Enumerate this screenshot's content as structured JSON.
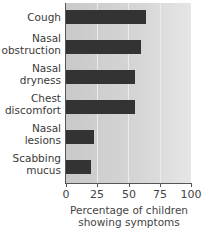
{
  "chart_data": {
    "type": "bar",
    "orientation": "horizontal",
    "title": "",
    "categories": [
      "Cough",
      "Nasal obstruction",
      "Nasal dryness",
      "Chest discomfort",
      "Nasal lesions",
      "Scabbing mucus"
    ],
    "category_labels": [
      "Cough",
      "Nasal\nobstruction",
      "Nasal\ndryness",
      "Chest\ndiscomfort",
      "Nasal\nlesions",
      "Scabbing\nmucus"
    ],
    "values": [
      64,
      60,
      55,
      55,
      22,
      20
    ],
    "xlabel": "Percentage of children\nshowing symptoms",
    "ylabel": "",
    "xlim": [
      0,
      100
    ],
    "xticks": [
      "0",
      "25",
      "50",
      "75",
      "100"
    ],
    "grid": true,
    "legend": null,
    "bar_color": "#333333"
  }
}
